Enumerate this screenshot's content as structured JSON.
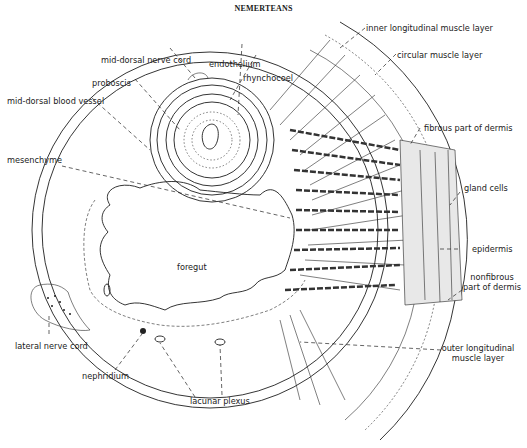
{
  "figure": {
    "title": "NEMERTEANS",
    "labels": {
      "inner_longitudinal_muscle_layer": "inner longitudinal muscle layer",
      "circular_muscle_layer": "circular muscle layer",
      "fibrous_part_of_dermis": "fibrous part of dermis",
      "gland_cells": "gland cells",
      "epidermis": "epidermis",
      "nonfibrous_part_of_dermis_line1": "nonfibrous",
      "nonfibrous_part_of_dermis_line2": "part of dermis",
      "outer_longitudinal_muscle_layer_line1": "outer longitudinal",
      "outer_longitudinal_muscle_layer_line2": "muscle layer",
      "mid_dorsal_nerve_cord": "mid-dorsal nerve cord",
      "endothelium": "endothelium",
      "rhynchocoel": "rhynchocoel",
      "proboscis": "proboscis",
      "mid_dorsal_blood_vessel": "mid-dorsal blood vessel",
      "mesenchyme": "mesenchyme",
      "foregut": "foregut",
      "lateral_nerve_cord": "lateral nerve cord",
      "nephridium": "nephridium",
      "lacunar_plexus": "lacunar plexus"
    },
    "colors": {
      "ink": "#1e1e1e",
      "background": "#ffffff"
    }
  }
}
